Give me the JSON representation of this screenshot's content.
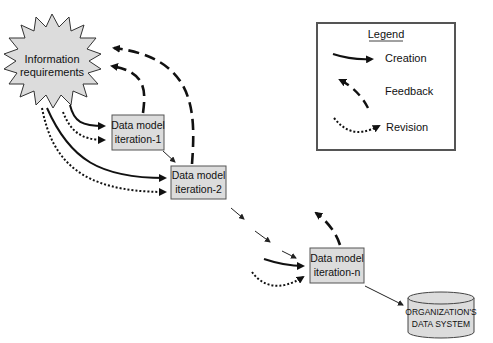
{
  "diagram": {
    "nodes": {
      "info_requirements": {
        "line1": "Information",
        "line2": "requirements"
      },
      "iteration_1": {
        "line1": "Data model",
        "line2": "iteration-1"
      },
      "iteration_2": {
        "line1": "Data model",
        "line2": "iteration-2"
      },
      "iteration_n": {
        "line1": "Data model",
        "line2": "iteration-n"
      },
      "data_system": {
        "line1": "ORGANIZATION'S",
        "line2": "DATA SYSTEM"
      }
    },
    "legend": {
      "title": "Legend",
      "items": [
        {
          "label": "Creation",
          "style": "solid"
        },
        {
          "label": "Feedback",
          "style": "dashed"
        },
        {
          "label": "Revision",
          "style": "dotted"
        }
      ]
    },
    "colors": {
      "node_fill": "#dcdcdc",
      "stroke": "#111111",
      "legend_border": "#555555"
    }
  }
}
